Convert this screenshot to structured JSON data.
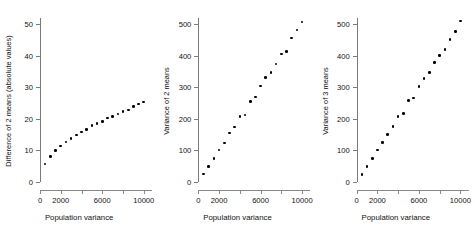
{
  "chart_data": [
    {
      "type": "scatter",
      "title": "",
      "xlabel": "Population variance",
      "ylabel": "Difference of 2 means (absolute values)",
      "xlim": [
        0,
        10600
      ],
      "ylim": [
        0,
        52
      ],
      "xticks": [
        0,
        2000,
        4000,
        6000,
        8000,
        10000
      ],
      "xticklabels": [
        "0",
        "2000",
        "",
        "6000",
        "",
        "10000"
      ],
      "yticks": [
        0,
        10,
        20,
        30,
        40,
        50
      ],
      "yticklabels": [
        "0",
        "10",
        "20",
        "30",
        "40",
        "50"
      ],
      "grid": false,
      "legend": null,
      "marker": "filled-circle",
      "marker_color": "#000000",
      "x": [
        500,
        1000,
        1500,
        2000,
        2500,
        3000,
        3500,
        4000,
        4500,
        5000,
        5500,
        6000,
        6500,
        7000,
        7500,
        8000,
        8500,
        9000,
        9500,
        10000
      ],
      "y": [
        5.7,
        8.0,
        9.9,
        11.4,
        12.7,
        13.8,
        14.9,
        15.9,
        16.6,
        17.9,
        18.6,
        19.2,
        20.3,
        20.8,
        21.5,
        22.3,
        22.8,
        23.9,
        24.7,
        25.4
      ]
    },
    {
      "type": "scatter",
      "title": "",
      "xlabel": "Population variance",
      "ylabel": "Variance of 2 means",
      "xlim": [
        0,
        10600
      ],
      "ylim": [
        0,
        520
      ],
      "xticks": [
        0,
        2000,
        4000,
        6000,
        8000,
        10000
      ],
      "xticklabels": [
        "0",
        "2000",
        "",
        "6000",
        "",
        "10000"
      ],
      "yticks": [
        0,
        100,
        200,
        300,
        400,
        500
      ],
      "yticklabels": [
        "0",
        "100",
        "200",
        "300",
        "400",
        "500"
      ],
      "grid": false,
      "legend": null,
      "marker": "filled-circle",
      "marker_color": "#000000",
      "x": [
        500,
        1000,
        1500,
        2000,
        2500,
        3000,
        3500,
        4000,
        4500,
        5000,
        5500,
        6000,
        6500,
        7000,
        7500,
        8000,
        8500,
        9000,
        9500,
        10000
      ],
      "y": [
        25,
        50,
        75,
        102,
        124,
        155,
        174,
        207,
        213,
        255,
        269,
        304,
        331,
        348,
        374,
        406,
        413,
        456,
        482,
        507
      ]
    },
    {
      "type": "scatter",
      "title": "",
      "xlabel": "Population variance",
      "ylabel": "Variance of 3 means",
      "xlim": [
        0,
        10600
      ],
      "ylim": [
        0,
        520
      ],
      "xticks": [
        0,
        2000,
        4000,
        6000,
        8000,
        10000
      ],
      "xticklabels": [
        "0",
        "2000",
        "",
        "6000",
        "",
        "10000"
      ],
      "yticks": [
        0,
        100,
        200,
        300,
        400,
        500
      ],
      "yticklabels": [
        "0",
        "100",
        "200",
        "300",
        "400",
        "500"
      ],
      "grid": false,
      "legend": null,
      "marker": "filled-circle",
      "marker_color": "#000000",
      "x": [
        500,
        1000,
        1500,
        2000,
        2500,
        3000,
        3500,
        4000,
        4500,
        5000,
        5500,
        6000,
        6500,
        7000,
        7500,
        8000,
        8500,
        9000,
        9500,
        10000
      ],
      "y": [
        24,
        49,
        75,
        101,
        125,
        151,
        176,
        207,
        217,
        258,
        266,
        302,
        328,
        347,
        378,
        402,
        421,
        451,
        478,
        510
      ]
    }
  ],
  "panels": [
    {
      "ylabel": "Difference of 2 means (absolute values)",
      "xlabel": "Population variance"
    },
    {
      "ylabel": "Variance of 2 means",
      "xlabel": "Population variance"
    },
    {
      "ylabel": "Variance of 3 means",
      "xlabel": "Population variance"
    }
  ]
}
